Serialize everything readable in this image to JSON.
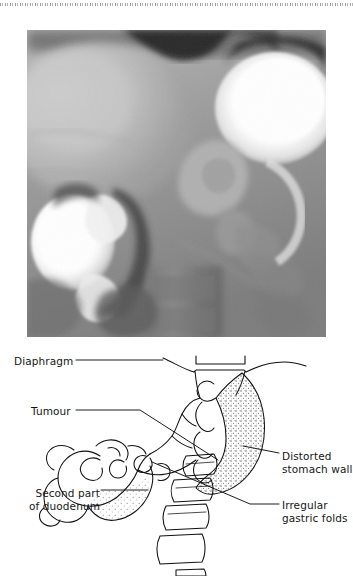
{
  "figure": {
    "kind": "medical-figure",
    "radiograph": {
      "name": "barium-meal-radiograph",
      "description": "Double-contrast barium meal radiograph of the stomach and duodenum",
      "tone_dark": "#2a2a2a",
      "tone_mid": "#8e8e8e",
      "tone_light": "#e8e8e8",
      "tone_barium": "#ffffff"
    },
    "line_drawing": {
      "name": "annotated-line-drawing",
      "stroke": "#111111",
      "stipple": "#555555"
    }
  },
  "labels": [
    {
      "id": "diaphragm",
      "text": "Diaphragm",
      "side": "left"
    },
    {
      "id": "tumour",
      "text": "Tumour",
      "side": "left"
    },
    {
      "id": "second-part-of-duodenum",
      "text": "Second part\nof duodenum",
      "side": "left"
    },
    {
      "id": "distorted-stomach-wall",
      "text": "Distorted\nstomach wall",
      "side": "right"
    },
    {
      "id": "irregular-gastric-folds",
      "text": "Irregular\ngastric folds",
      "side": "right"
    }
  ],
  "label_text": {
    "diaphragm": "Diaphragm",
    "tumour": "Tumour",
    "duodenum": "Second part\nof duodenum",
    "stomach_wall": "Distorted\nstomach wall",
    "gastric_folds": "Irregular\ngastric folds"
  }
}
